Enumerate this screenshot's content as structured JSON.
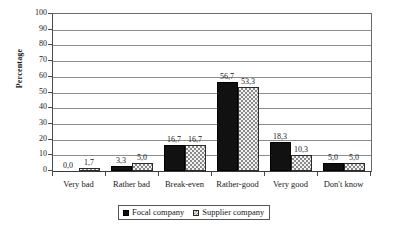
{
  "chart_data": {
    "type": "bar",
    "title": "",
    "xlabel": "",
    "ylabel": "Percentage",
    "ylim": [
      0,
      100
    ],
    "ytick_step": 10,
    "yticks": [
      100,
      90,
      80,
      70,
      60,
      50,
      40,
      30,
      20,
      10,
      0
    ],
    "ytick_labels": [
      "100",
      "90",
      "80",
      "70",
      "60",
      "50",
      "40",
      "30",
      "20",
      "10",
      "0"
    ],
    "grid": true,
    "legend_position": "bottom",
    "decimal_separator": ",",
    "categories": [
      "Very bad",
      "Rather bad",
      "Break-even",
      "Rather-good",
      "Very good",
      "Don't know"
    ],
    "series": [
      {
        "name": "Focal company",
        "color": "#111111",
        "pattern": "solid",
        "values": [
          0.0,
          3.3,
          16.7,
          56.7,
          18.3,
          5.0
        ],
        "labels": [
          "0,0",
          "3,3",
          "16,7",
          "56,7",
          "18,3",
          "5,0"
        ]
      },
      {
        "name": "Supplier company",
        "color": "#f2f2f2",
        "pattern": "checkered",
        "values": [
          1.7,
          5.0,
          16.7,
          53.3,
          10.3,
          5.0
        ],
        "labels": [
          "1,7",
          "5,0",
          "16,7",
          "53,3",
          "10,3",
          "5,0"
        ]
      }
    ]
  },
  "legend": {
    "items": [
      {
        "label": "Focal company",
        "swatch": "solid-black-swatch"
      },
      {
        "label": "Supplier company",
        "swatch": "checkered-swatch"
      }
    ]
  }
}
